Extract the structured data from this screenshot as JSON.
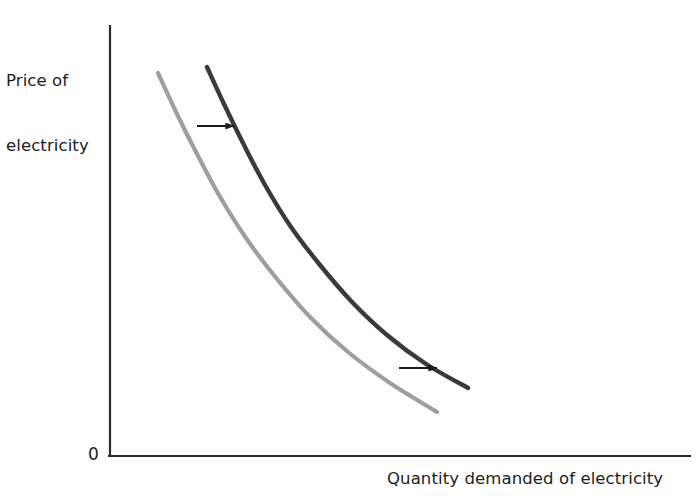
{
  "figure": {
    "background_color": "#fefefe",
    "origin_label": "0",
    "y_axis_label_line1": "Price of",
    "y_axis_label_line2": "electricity",
    "x_axis_label": "Quantity demanded of electricity"
  },
  "chart_data": {
    "type": "line",
    "title": "",
    "subtitle": "",
    "xlabel": "Quantity demanded of electricity",
    "ylabel": "Price of electricity",
    "xlim": [
      0,
      1
    ],
    "ylim": [
      0,
      1
    ],
    "grid": false,
    "legend": "none",
    "axis_ticks": {
      "x": [],
      "y": [],
      "origin": "0"
    },
    "series": [
      {
        "name": "Original demand curve",
        "color": "#9e9e9e",
        "width": 4.2,
        "points_px": [
          [
            158,
            73
          ],
          [
            176,
            112
          ],
          [
            196,
            152
          ],
          [
            219,
            195
          ],
          [
            246,
            238
          ],
          [
            277,
            279
          ],
          [
            311,
            318
          ],
          [
            348,
            352
          ],
          [
            390,
            383
          ],
          [
            437,
            412
          ]
        ]
      },
      {
        "name": "New demand curve",
        "color": "#3a3a3a",
        "width": 4.4,
        "points_px": [
          [
            207,
            67
          ],
          [
            224,
            104
          ],
          [
            243,
            143
          ],
          [
            265,
            185
          ],
          [
            291,
            227
          ],
          [
            320,
            265
          ],
          [
            352,
            302
          ],
          [
            387,
            335
          ],
          [
            426,
            364
          ],
          [
            468,
            388
          ]
        ]
      }
    ],
    "annotations": [
      {
        "name": "shift-arrow-upper",
        "type": "arrow",
        "direction": "right",
        "x_start_px": 197,
        "x_end_px": 236,
        "y_px": 126,
        "color": "#1c1c1c"
      },
      {
        "name": "shift-arrow-lower",
        "type": "arrow",
        "direction": "right",
        "x_start_px": 399,
        "x_end_px": 439,
        "y_px": 368,
        "color": "#1c1c1c"
      }
    ],
    "axes_px": {
      "y_axis": {
        "x": 110,
        "y_top": 26,
        "y_bottom": 456
      },
      "x_axis": {
        "y": 456,
        "x_left": 110,
        "x_right": 690
      },
      "color": "#2b2b2b",
      "width": 2.2
    }
  }
}
